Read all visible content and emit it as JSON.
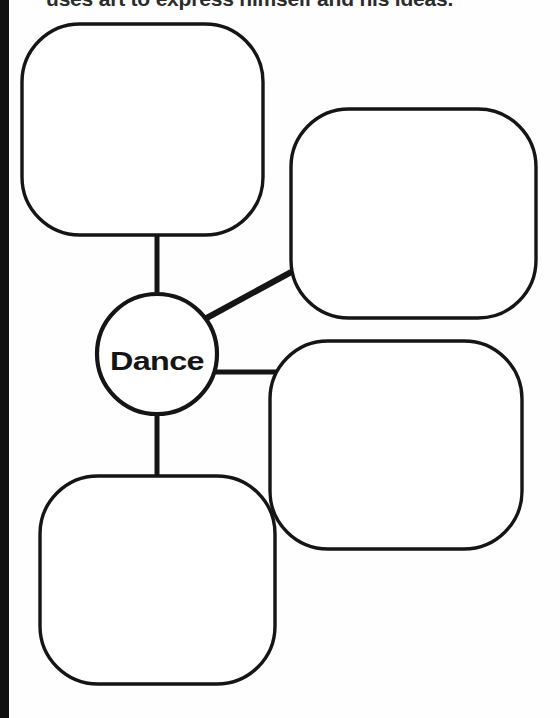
{
  "page": {
    "width": 560,
    "height": 718,
    "background_color": "#fefefe",
    "ink_color": "#151515",
    "spine_color": "#101010"
  },
  "instruction": {
    "text": "uses art to express himself and his ideas."
  },
  "diagram": {
    "type": "concept-map",
    "center": {
      "label": "Dance",
      "shape": "circle",
      "cx": 157,
      "cy": 354,
      "r": 60
    },
    "branches": [
      {
        "id": "top-left",
        "label": "",
        "placeholder": "",
        "shape": "rounded-square",
        "x": 22,
        "y": 24,
        "width": 241,
        "height": 211,
        "radius": 58,
        "connector": "vertical"
      },
      {
        "id": "top-right",
        "label": "",
        "placeholder": "",
        "shape": "rounded-square",
        "x": 291,
        "y": 109,
        "width": 245,
        "height": 209,
        "radius": 58,
        "connector": "diagonal"
      },
      {
        "id": "middle-right",
        "label": "",
        "placeholder": "",
        "shape": "rounded-square",
        "x": 270,
        "y": 341,
        "width": 252,
        "height": 208,
        "radius": 58,
        "connector": "horizontal"
      },
      {
        "id": "bottom-left",
        "label": "",
        "placeholder": "",
        "shape": "rounded-square",
        "x": 40,
        "y": 476,
        "width": 235,
        "height": 208,
        "radius": 58,
        "connector": "vertical"
      }
    ],
    "connectors": [
      {
        "id": "center-to-top-left",
        "x1": 157,
        "y1": 294,
        "x2": 157,
        "y2": 235
      },
      {
        "id": "center-to-top-right",
        "x1": 205,
        "y1": 318,
        "x2": 293,
        "y2": 271
      },
      {
        "id": "center-to-middle-right",
        "x1": 217,
        "y1": 372,
        "x2": 280,
        "y2": 372
      },
      {
        "id": "center-to-bottom-left",
        "x1": 157,
        "y1": 414,
        "x2": 157,
        "y2": 477
      }
    ]
  }
}
